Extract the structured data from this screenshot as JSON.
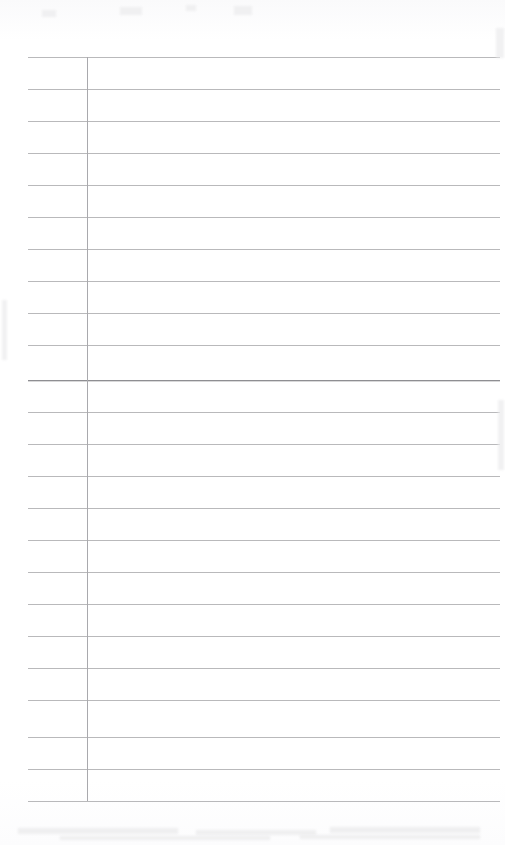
{
  "document": {
    "kind": "scanned-blank-lined-page",
    "title": "Blank Ruled Page",
    "page_width": 505,
    "page_height": 845,
    "background_color": "#fefefe",
    "content_text": "",
    "notes_text": ""
  },
  "ruling": {
    "line_color": "#b9b9bb",
    "heavy_line_color": "#8e8e92",
    "margin_line_color": "#a9a9ad",
    "line_left_x": 28,
    "line_right_x": 500,
    "line_spacing": 32,
    "first_line_y": 57,
    "last_line_y": 801,
    "margin_line_x": 87,
    "margin_line_top_y": 57,
    "margin_line_bottom_y": 801,
    "heavy_line_index": 10,
    "line_count": 24,
    "lines": [
      {
        "y": 57,
        "weight": "normal"
      },
      {
        "y": 89,
        "weight": "normal"
      },
      {
        "y": 121,
        "weight": "normal"
      },
      {
        "y": 153,
        "weight": "normal"
      },
      {
        "y": 185,
        "weight": "normal"
      },
      {
        "y": 217,
        "weight": "normal"
      },
      {
        "y": 249,
        "weight": "normal"
      },
      {
        "y": 281,
        "weight": "normal"
      },
      {
        "y": 313,
        "weight": "normal"
      },
      {
        "y": 345,
        "weight": "normal"
      },
      {
        "y": 380,
        "weight": "heavy"
      },
      {
        "y": 412,
        "weight": "normal"
      },
      {
        "y": 444,
        "weight": "normal"
      },
      {
        "y": 476,
        "weight": "normal"
      },
      {
        "y": 508,
        "weight": "normal"
      },
      {
        "y": 540,
        "weight": "normal"
      },
      {
        "y": 572,
        "weight": "normal"
      },
      {
        "y": 604,
        "weight": "normal"
      },
      {
        "y": 636,
        "weight": "normal"
      },
      {
        "y": 668,
        "weight": "normal"
      },
      {
        "y": 700,
        "weight": "normal"
      },
      {
        "y": 737,
        "weight": "normal"
      },
      {
        "y": 769,
        "weight": "normal"
      },
      {
        "y": 801,
        "weight": "normal"
      }
    ]
  },
  "artifacts": {
    "smudges": [
      {
        "x": 18,
        "y": 828,
        "w": 160,
        "h": 6
      },
      {
        "x": 196,
        "y": 830,
        "w": 120,
        "h": 5
      },
      {
        "x": 330,
        "y": 827,
        "w": 150,
        "h": 6
      },
      {
        "x": 60,
        "y": 836,
        "w": 210,
        "h": 4
      },
      {
        "x": 300,
        "y": 835,
        "w": 180,
        "h": 4
      }
    ],
    "specks": [
      {
        "x": 42,
        "y": 10,
        "w": 14,
        "h": 7
      },
      {
        "x": 120,
        "y": 7,
        "w": 22,
        "h": 8
      },
      {
        "x": 186,
        "y": 5,
        "w": 10,
        "h": 6
      },
      {
        "x": 234,
        "y": 6,
        "w": 18,
        "h": 9
      },
      {
        "x": 496,
        "y": 28,
        "w": 8,
        "h": 30
      },
      {
        "x": 2,
        "y": 300,
        "w": 5,
        "h": 60
      },
      {
        "x": 498,
        "y": 400,
        "w": 6,
        "h": 70
      }
    ]
  }
}
